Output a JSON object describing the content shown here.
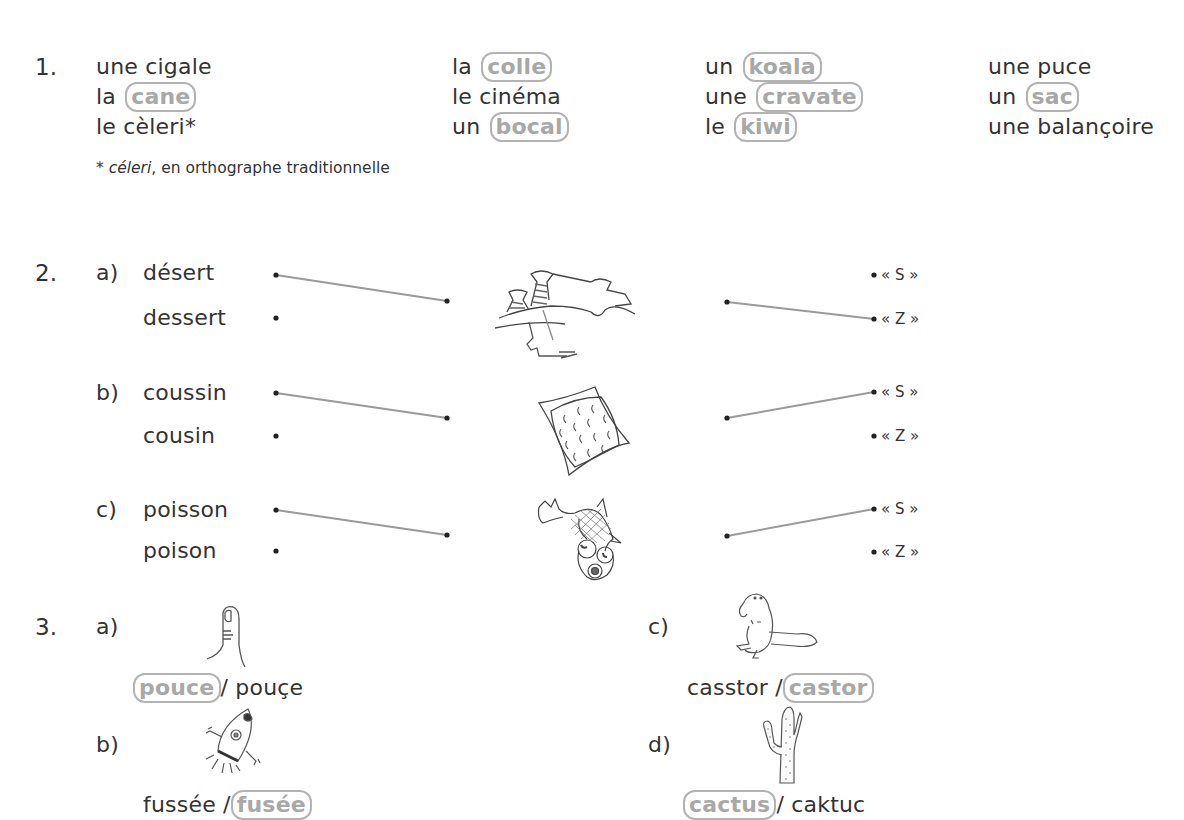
{
  "section1": {
    "number": "1.",
    "columns": [
      [
        {
          "article": "une cigale",
          "circled": null
        },
        {
          "article": "la",
          "circled": "cane"
        },
        {
          "article": "le cèleri*",
          "circled": null
        }
      ],
      [
        {
          "article": "la",
          "circled": "colle"
        },
        {
          "article": "le cinéma",
          "circled": null
        },
        {
          "article": "un",
          "circled": "bocal"
        }
      ],
      [
        {
          "article": "un",
          "circled": "koala"
        },
        {
          "article": "une",
          "circled": "cravate"
        },
        {
          "article": "le",
          "circled": "kiwi"
        }
      ],
      [
        {
          "article": "une puce",
          "circled": null
        },
        {
          "article": "un",
          "circled": "sac"
        },
        {
          "article": "une balançoire",
          "circled": null
        }
      ]
    ],
    "footnote_mark": "* ",
    "footnote_italic": "céleri",
    "footnote_rest": ", en orthographe traditionnelle"
  },
  "section2": {
    "number": "2.",
    "items": [
      {
        "letter": "a)",
        "word1": "désert",
        "word2": "dessert",
        "image": "desert-landscape",
        "s_label": "« S »",
        "z_label": "« Z »"
      },
      {
        "letter": "b)",
        "word1": "coussin",
        "word2": "cousin",
        "image": "cushion",
        "s_label": "« S »",
        "z_label": "« Z »"
      },
      {
        "letter": "c)",
        "word1": "poisson",
        "word2": "poison",
        "image": "fish",
        "s_label": "« S »",
        "z_label": "« Z »"
      }
    ]
  },
  "section3": {
    "number": "3.",
    "items": [
      {
        "letter": "a)",
        "image": "thumb",
        "option1": "pouce",
        "sep": "/ ",
        "option2": "pouçe",
        "correct": "pouce"
      },
      {
        "letter": "b)",
        "image": "rocket",
        "option1": "fussée",
        "sep": " /",
        "option2": "fusée",
        "correct": "fusée"
      },
      {
        "letter": "c)",
        "image": "beaver",
        "option1": "casstor",
        "sep": " /",
        "option2": "castor",
        "correct": "castor"
      },
      {
        "letter": "d)",
        "image": "cactus",
        "option1": "cactus",
        "sep": "/ ",
        "option2": "caktuc",
        "correct": "cactus"
      }
    ]
  },
  "colors": {
    "text": "#333333",
    "circle_border": "#b3b3b3",
    "circle_text": "#a8a8a8",
    "answer_line": "#9a9a9a"
  }
}
